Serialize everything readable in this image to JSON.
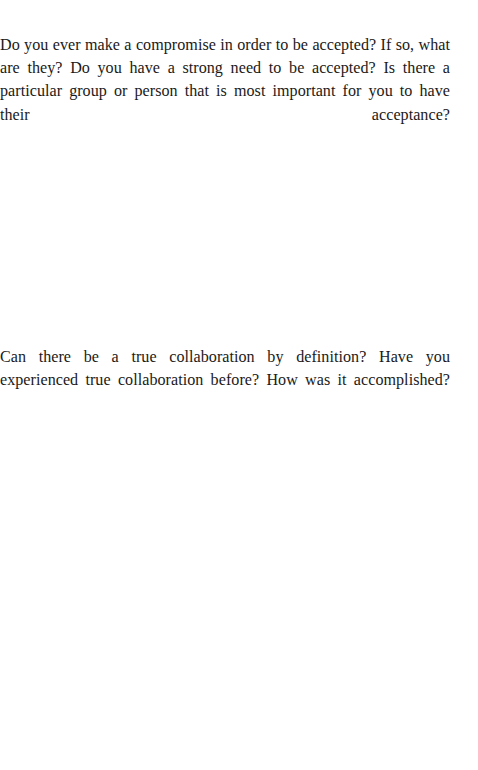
{
  "page": {
    "background_color": "#ffffff",
    "text_color": "#1b1a19",
    "kind": "workbook-reflection-page"
  },
  "content": {
    "prompts": [
      {
        "id": "acceptance",
        "text": "Do you ever make a compromise in order to be accepted? If so, what are they? Do you have a strong need to be accepted? Is there a particular group or person that is most important for you to have their acceptance?",
        "lines": [
          "Do you ever make a compromise in order to be accepted? If so, what are",
          "they? Do you have a strong need to be accepted? Is there a particular group",
          "or person that is most important for you to have their acceptance?"
        ]
      },
      {
        "id": "collaboration",
        "text": "Can there be a true collaboration by definition? Have you experienced true collaboration before? How was it accomplished?",
        "lines": [
          "Can there be a true collaboration by definition? Have you experienced true",
          "collaboration before? How was it accomplished?"
        ]
      }
    ]
  }
}
